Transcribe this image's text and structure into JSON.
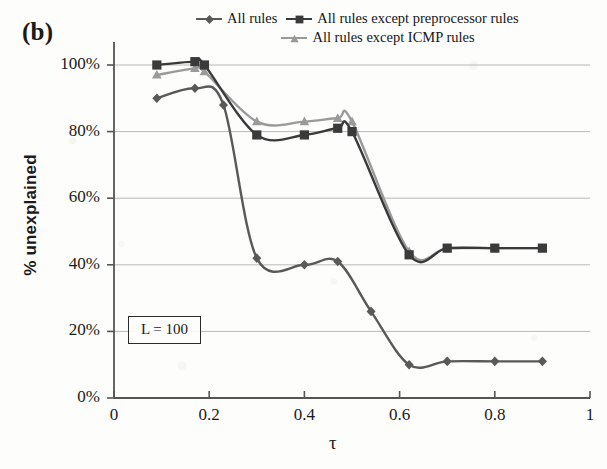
{
  "panel": {
    "label": "(b)"
  },
  "annotation": {
    "text": "L = 100"
  },
  "legend": {
    "entries": [
      {
        "label": "All rules",
        "marker": "diamond-marker-icon",
        "color": "#595959"
      },
      {
        "label": "All rules except preprocessor  rules",
        "marker": "square-marker-icon",
        "color": "#3a3a3a"
      },
      {
        "label": "All rules except ICMP rules",
        "marker": "triangle-marker-icon",
        "color": "#9a9a9a"
      }
    ]
  },
  "chart_data": {
    "type": "line",
    "title": "",
    "xlabel": "τ",
    "ylabel": "% unexplained",
    "xlim": [
      0,
      1
    ],
    "ylim": [
      0,
      1.0
    ],
    "xticks": [
      0,
      0.2,
      0.4,
      0.6,
      0.8,
      1
    ],
    "xticklabels": [
      "0",
      "0.2",
      "0.4",
      "0.6",
      "0.8",
      "1"
    ],
    "yticks": [
      0,
      0.2,
      0.4,
      0.6,
      0.8,
      1.0
    ],
    "yticklabels": [
      "0%",
      "20%",
      "40%",
      "60%",
      "80%",
      "100%"
    ],
    "grid": "horizontal",
    "legend_position": "top",
    "series": [
      {
        "name": "All rules",
        "color": "#595959",
        "marker": "diamond",
        "x": [
          0.09,
          0.17,
          0.23,
          0.3,
          0.4,
          0.47,
          0.54,
          0.62,
          0.7,
          0.8,
          0.9
        ],
        "y": [
          0.9,
          0.93,
          0.88,
          0.42,
          0.4,
          0.41,
          0.26,
          0.1,
          0.11,
          0.11,
          0.11
        ]
      },
      {
        "name": "All rules except preprocessor  rules",
        "color": "#3a3a3a",
        "marker": "square",
        "x": [
          0.09,
          0.17,
          0.19,
          0.3,
          0.4,
          0.47,
          0.5,
          0.62,
          0.7,
          0.8,
          0.9
        ],
        "y": [
          1.0,
          1.01,
          1.0,
          0.79,
          0.79,
          0.81,
          0.8,
          0.43,
          0.45,
          0.45,
          0.45
        ]
      },
      {
        "name": "All rules except ICMP rules",
        "color": "#9a9a9a",
        "marker": "triangle",
        "x": [
          0.09,
          0.17,
          0.19,
          0.3,
          0.4,
          0.47,
          0.5,
          0.62,
          0.7,
          0.8,
          0.9
        ],
        "y": [
          0.97,
          0.99,
          0.98,
          0.83,
          0.83,
          0.84,
          0.83,
          0.44,
          0.45,
          0.45,
          0.45
        ]
      }
    ]
  }
}
